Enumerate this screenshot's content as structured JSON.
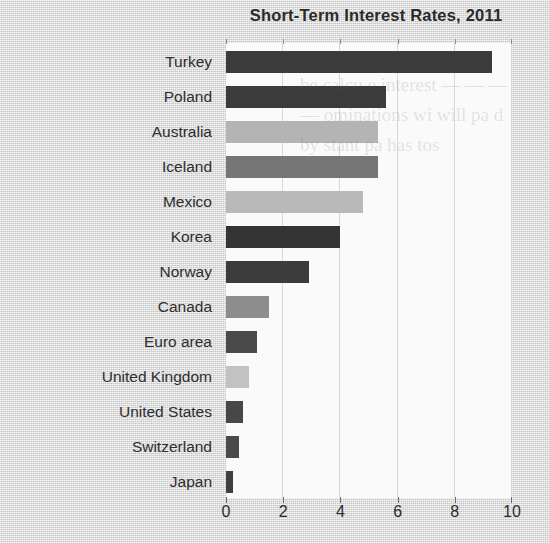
{
  "chart_data": {
    "type": "bar",
    "orientation": "horizontal",
    "title": "Short-Term Interest Rates, 2011",
    "xlabel": "",
    "ylabel": "",
    "xlim": [
      0,
      10
    ],
    "xticks": [
      0,
      2,
      4,
      6,
      8,
      10
    ],
    "xtick_labels": [
      "0",
      "2",
      "4",
      "6",
      "8",
      "10"
    ],
    "grid": "vertical",
    "legend": "none",
    "categories": [
      "Turkey",
      "Poland",
      "Australia",
      "Iceland",
      "Mexico",
      "Korea",
      "Norway",
      "Canada",
      "Euro area",
      "United Kingdom",
      "United States",
      "Switzerland",
      "Japan"
    ],
    "values": [
      9.3,
      5.6,
      5.3,
      5.3,
      4.8,
      4.0,
      2.9,
      1.5,
      1.1,
      0.8,
      0.6,
      0.45,
      0.25
    ],
    "bar_colors": [
      "#3b3b3b",
      "#3b3b3b",
      "#b4b4b4",
      "#767676",
      "#b9b9b9",
      "#343434",
      "#3c3c3c",
      "#8d8d8d",
      "#4a4a4a",
      "#c2c2c2",
      "#474747",
      "#4a4a4a",
      "#3f3f3f"
    ]
  },
  "colors": {
    "page_background": "#d2d2d2",
    "plot_background": "#fafafa",
    "gridline": "#d8d8d8",
    "text": "#2b2b2b"
  },
  "bleed_text": "be calcu e interest — — — — ominations wi will pa d by stant pa has tos"
}
